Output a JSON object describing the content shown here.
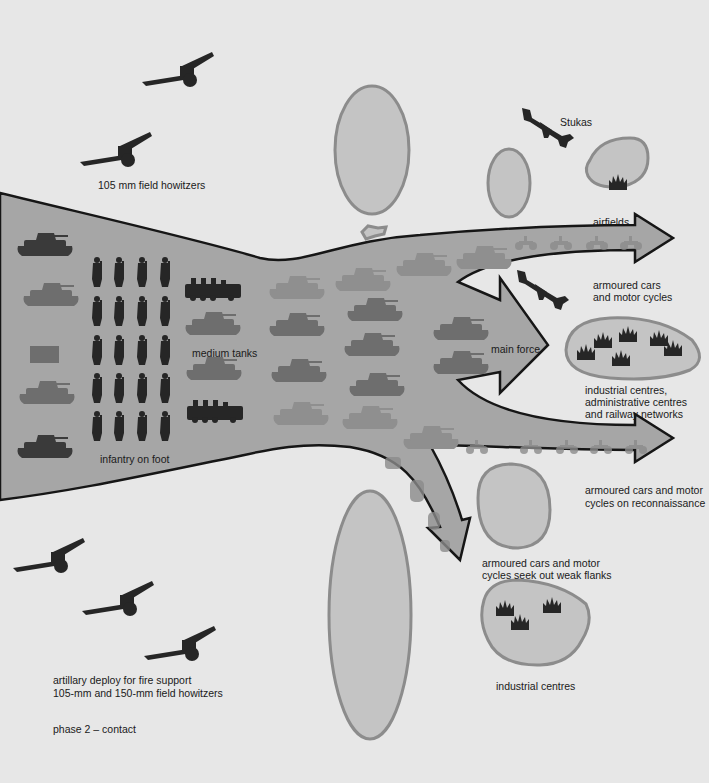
{
  "diagram": {
    "title": "phase 2 – contact",
    "colors": {
      "background": "#e7e7e7",
      "arrow_fill": "#a6a6a6",
      "arrow_outline": "#161616",
      "target_zone_fill": "#c4c4c4",
      "target_zone_outline": "#8c8c8c",
      "silhouette": "#262626"
    },
    "labels": {
      "howitzers_top": "105 mm field howitzers",
      "stukas": "Stukas",
      "airfields": "airfields",
      "armoured_cars_1": "armoured cars",
      "armoured_cars_2": "and motor cycles",
      "main_force": "main force",
      "industrial_1": "industrial centres,",
      "industrial_2": "administrative centres",
      "industrial_3": "and railway networks",
      "medium_tanks": "medium tanks",
      "infantry": "infantry on foot",
      "recon_1": "armoured cars and motor",
      "recon_2": "cycles on reconnaissance",
      "flanks_1": "armoured cars and motor",
      "flanks_2": "cycles seek out weak flanks",
      "industrial_bottom": "industrial centres",
      "artillery_1": "artillary deploy for fire support",
      "artillery_2": "105-mm and 150-mm field howitzers",
      "phase": "phase 2 – contact"
    },
    "icons": {
      "howitzer": "field-howitzer-icon",
      "stuka": "stuka-dive-bomber-icon",
      "tank": "tank-icon",
      "halftrack": "halftrack-icon",
      "soldier": "infantry-soldier-icon",
      "factory": "industrial-target-icon",
      "motorcycle": "motorcycle-icon"
    },
    "counts": {
      "infantry_rows": 5,
      "infantry_cols": 4,
      "howitzers_top": 2,
      "howitzers_bottom": 3,
      "stukas": 2
    }
  }
}
